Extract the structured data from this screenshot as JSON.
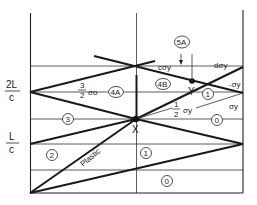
{
  "diagram": {
    "type": "wave-propagation x-t diagram",
    "axis_labels": {
      "t_2L_c": {
        "num": "2L",
        "den": "c"
      },
      "t_L_c": {
        "num": "L",
        "den": "c"
      }
    },
    "points": {
      "X": "X",
      "Y": "Y"
    },
    "regions": {
      "r0_bottom": "0",
      "r1_mid": "1",
      "r2": "2",
      "r3": "3",
      "r0_right": "0",
      "r1_right": "1",
      "r4A": "4A",
      "r4B": "4B",
      "r5A": "5A"
    },
    "annotations": {
      "plastic": "Plastic",
      "three_halves_num": "3",
      "three_halves_den": "2",
      "sigma_o": "σo",
      "half_num": "1",
      "half_den": "2",
      "sigma_y": "σy",
      "c_sigma_y": "cσy",
      "d_sigma_y": "dσy",
      "neg_sigma_y": "-σy",
      "sigma_y_right": "σy"
    }
  }
}
